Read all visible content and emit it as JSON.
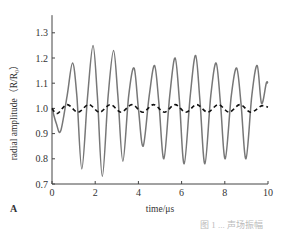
{
  "chart_data": {
    "type": "line",
    "title": "",
    "xlabel": "time/μs",
    "ylabel": "radial amplitude（R/R₀）",
    "xlim": [
      0,
      10
    ],
    "ylim": [
      0.7,
      1.35
    ],
    "xticks": [
      0,
      2,
      4,
      6,
      8,
      10
    ],
    "yticks": [
      0.7,
      0.8,
      0.9,
      1.0,
      1.1,
      1.2,
      1.3
    ],
    "grid": false,
    "legend": null,
    "panel_label": "A",
    "series": [
      {
        "name": "solid (gray)",
        "style": "solid",
        "color": "#777777",
        "x": [
          0,
          0.2,
          0.4,
          0.7,
          0.95,
          1.15,
          1.38,
          1.65,
          1.9,
          2.1,
          2.33,
          2.6,
          2.85,
          3.05,
          3.28,
          3.55,
          3.8,
          4.0,
          4.22,
          4.5,
          4.75,
          4.95,
          5.18,
          5.45,
          5.7,
          5.9,
          6.12,
          6.4,
          6.65,
          6.85,
          7.08,
          7.35,
          7.6,
          7.8,
          8.02,
          8.3,
          8.55,
          8.75,
          8.98,
          9.25,
          9.5,
          9.7,
          9.92,
          10.0
        ],
        "y": [
          1.0,
          0.94,
          0.91,
          1.05,
          1.18,
          1.05,
          0.76,
          1.05,
          1.25,
          1.05,
          0.73,
          1.05,
          1.23,
          1.05,
          0.79,
          1.05,
          1.16,
          1.0,
          0.85,
          1.05,
          1.17,
          1.02,
          0.8,
          1.05,
          1.2,
          1.03,
          0.78,
          1.05,
          1.21,
          1.03,
          0.78,
          1.05,
          1.18,
          1.02,
          0.8,
          1.05,
          1.16,
          1.02,
          0.8,
          1.05,
          1.17,
          1.02,
          1.1,
          1.1
        ]
      },
      {
        "name": "dashed (black)",
        "style": "dashed",
        "color": "#111111",
        "x": [
          0,
          0.25,
          0.7,
          1.2,
          1.7,
          2.2,
          2.7,
          3.2,
          3.7,
          4.2,
          4.7,
          5.2,
          5.7,
          6.2,
          6.7,
          7.2,
          7.7,
          8.2,
          8.7,
          9.2,
          9.7,
          10.0
        ],
        "y": [
          1.0,
          0.98,
          1.015,
          0.985,
          1.015,
          0.985,
          1.015,
          0.985,
          1.015,
          0.985,
          1.015,
          0.985,
          1.015,
          0.985,
          1.015,
          0.985,
          1.015,
          0.985,
          1.015,
          0.985,
          1.01,
          1.005
        ]
      }
    ]
  },
  "labels": {
    "panel": "A",
    "caption": "图 1 ... 声场振幅"
  }
}
